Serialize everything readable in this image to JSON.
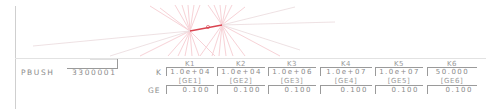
{
  "card": {
    "name": "PBUSH",
    "id": "3300001"
  },
  "row_labels": {
    "k": "K",
    "ge": "GE"
  },
  "columns": [
    {
      "header": "K1",
      "ge_label": "[GE1]",
      "k_value": "1.0e+04",
      "ge_value": "0.100"
    },
    {
      "header": "K2",
      "ge_label": "[GE2]",
      "k_value": "1.0e+04",
      "ge_value": "0.100"
    },
    {
      "header": "K3",
      "ge_label": "[GE3]",
      "k_value": "1.0e+06",
      "ge_value": "0.100"
    },
    {
      "header": "K4",
      "ge_label": "[GE4]",
      "k_value": "1.0e+07",
      "ge_value": "0.100"
    },
    {
      "header": "K5",
      "ge_label": "[GE5]",
      "k_value": "1.0e+07",
      "ge_value": "0.100"
    },
    {
      "header": "K6",
      "ge_label": "[GE6]",
      "k_value": "50.000",
      "ge_value": "0.100"
    }
  ],
  "colors": {
    "graphics_lines": "#f4b9c0",
    "element_highlight": "#d9434f",
    "text": "#8a8a8a",
    "border": "#9a9a9a"
  }
}
